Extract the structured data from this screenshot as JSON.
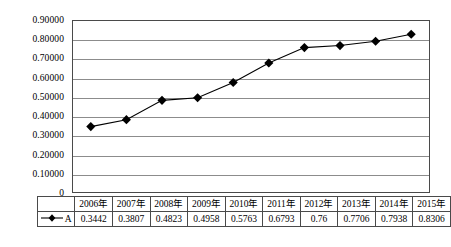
{
  "chart_data": {
    "type": "line",
    "title": "",
    "xlabel": "",
    "ylabel": "",
    "categories": [
      "2006年",
      "2007年",
      "2008年",
      "2009年",
      "2010年",
      "2011年",
      "2012年",
      "2013年",
      "2014年",
      "2015年"
    ],
    "series": [
      {
        "name": "A",
        "values": [
          0.3442,
          0.3807,
          0.4823,
          0.4958,
          0.5763,
          0.6793,
          0.76,
          0.7706,
          0.7938,
          0.8306
        ],
        "value_labels": [
          "0.3442",
          "0.3807",
          "0.4823",
          "0.4958",
          "0.5763",
          "0.6793",
          "0.76",
          "0.7706",
          "0.7938",
          "0.8306"
        ],
        "marker": "filled-diamond",
        "color": "#000000"
      }
    ],
    "ylim": [
      0,
      0.9
    ],
    "ytick_labels": [
      "0.90000",
      "0.80000",
      "0.70000",
      "0.60000",
      "0.50000",
      "0.40000",
      "0.30000",
      "0.20000",
      "0.10000",
      "0"
    ],
    "ytick_values": [
      0.9,
      0.8,
      0.7,
      0.6,
      0.5,
      0.4,
      0.3,
      0.2,
      0.1,
      0
    ],
    "grid": true,
    "grid_color": "#8c8c8c",
    "legend_position": "data-table",
    "has_data_table": true
  },
  "data_table": {
    "legend_header_blank": "",
    "legend_series_label": "A",
    "header_row": [
      "2006年",
      "2007年",
      "2008年",
      "2009年",
      "2010年",
      "2011年",
      "2012年",
      "2013年",
      "2014年",
      "2015年"
    ],
    "value_row": [
      "0.3442",
      "0.3807",
      "0.4823",
      "0.4958",
      "0.5763",
      "0.6793",
      "0.76",
      "0.7706",
      "0.7938",
      "0.8306"
    ]
  },
  "colors": {
    "plot_border": "#4a4a4a",
    "gridline": "#8c8c8c",
    "series_line": "#000000",
    "marker_fill": "#000000",
    "background": "#ffffff",
    "text": "#000000"
  }
}
